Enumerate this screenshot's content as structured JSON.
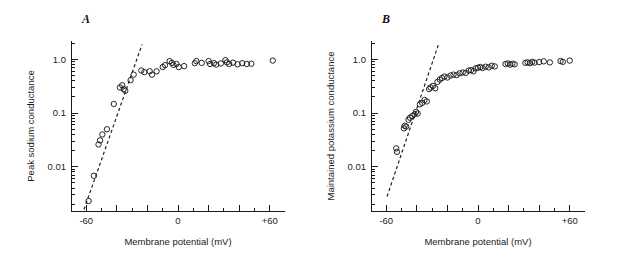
{
  "figure": {
    "background": "#ffffff",
    "ink_color": "#1a1a1a",
    "width": 620,
    "height": 263
  },
  "panels": [
    {
      "id": "A",
      "label": "A",
      "xlabel": "Membrane potential (mV)",
      "ylabel": "Peak sodium conductance"
    },
    {
      "id": "B",
      "label": "B",
      "xlabel": "Membrane potential (mV)",
      "ylabel": "Maintained potassium conductance"
    }
  ],
  "chart_data": [
    {
      "type": "scatter",
      "panel": "A",
      "title": "A",
      "xlabel": "Membrane potential (mV)",
      "ylabel": "Peak sodium conductance",
      "xlim": [
        -70,
        70
      ],
      "ylim": [
        0.0015,
        2.2
      ],
      "yscale": "log",
      "grid": false,
      "legend": null,
      "xticks": [
        -60,
        -40,
        -20,
        0,
        20,
        40,
        60
      ],
      "xticklabels": [
        "-60",
        "",
        "",
        "0",
        "",
        "",
        "+60"
      ],
      "xtick_minor_step": 10,
      "yticks": [
        1.0,
        0.1,
        0.01
      ],
      "yticklabels": [
        "1.0",
        "0.1",
        "0.01"
      ],
      "marker": "open-circle",
      "annotations": [
        {
          "type": "dashed-fit-line",
          "x0": -61.5,
          "y0": 0.0016,
          "x1": -23.5,
          "y1": 1.9
        }
      ],
      "x": [
        -58.5,
        -55.0,
        -52.0,
        -51.0,
        -49.5,
        -46.5,
        -42.0,
        -38.0,
        -36.5,
        -35.5,
        -34.5,
        -31.0,
        -29.0,
        -24.0,
        -22.0,
        -18.5,
        -17.0,
        -14.0,
        -10.0,
        -8.5,
        -5.5,
        -4.0,
        -3.0,
        -1.0,
        0.5,
        4.0,
        11.0,
        12.0,
        15.5,
        20.0,
        21.0,
        23.5,
        25.0,
        28.0,
        31.0,
        32.0,
        33.5,
        36.0,
        39.0,
        42.0,
        45.0,
        48.0,
        62.0
      ],
      "y": [
        0.0023,
        0.0068,
        0.026,
        0.031,
        0.04,
        0.05,
        0.148,
        0.3,
        0.33,
        0.28,
        0.26,
        0.41,
        0.52,
        0.62,
        0.58,
        0.6,
        0.52,
        0.6,
        0.72,
        0.78,
        0.93,
        0.86,
        0.79,
        0.82,
        0.72,
        0.75,
        0.85,
        0.93,
        0.86,
        0.93,
        0.82,
        0.85,
        0.8,
        0.84,
        0.97,
        0.88,
        0.82,
        0.87,
        0.81,
        0.85,
        0.82,
        0.83,
        0.95
      ]
    },
    {
      "type": "scatter",
      "panel": "B",
      "title": "B",
      "xlabel": "Membrane potential (mV)",
      "ylabel": "Maintained potassium conductance",
      "xlim": [
        -70,
        70
      ],
      "ylim": [
        0.0015,
        2.2
      ],
      "yscale": "log",
      "grid": false,
      "legend": null,
      "xticks": [
        -60,
        -40,
        -20,
        0,
        20,
        40,
        60
      ],
      "xticklabels": [
        "-60",
        "",
        "",
        "0",
        "",
        "",
        "+60"
      ],
      "xtick_minor_step": 10,
      "yticks": [
        1.0,
        0.1,
        0.01
      ],
      "yticklabels": [
        "1.0",
        "0.1",
        "0.01"
      ],
      "marker": "open-circle",
      "annotations": [
        {
          "type": "dashed-fit-line",
          "x0": -59.5,
          "y0": 0.0028,
          "x1": -26.0,
          "y1": 1.85
        }
      ],
      "x": [
        -53.5,
        -53.0,
        -48.5,
        -48.0,
        -47.0,
        -45.5,
        -44.5,
        -43.0,
        -41.5,
        -40.5,
        -39.5,
        -38.0,
        -36.5,
        -35.0,
        -33.5,
        -32.0,
        -31.0,
        -29.5,
        -28.0,
        -26.5,
        -25.0,
        -23.5,
        -22.0,
        -20.0,
        -18.0,
        -16.0,
        -14.0,
        -12.0,
        -10.0,
        -8.0,
        -6.0,
        -4.5,
        -3.0,
        -1.5,
        0.0,
        1.5,
        3.0,
        5.0,
        7.0,
        9.0,
        11.0,
        18.0,
        19.5,
        21.0,
        22.5,
        24.0,
        31.0,
        32.5,
        34.0,
        35.5,
        37.0,
        40.0,
        43.0,
        47.0,
        54.0,
        55.5,
        60.0
      ],
      "y": [
        0.022,
        0.019,
        0.052,
        0.058,
        0.056,
        0.075,
        0.082,
        0.088,
        0.095,
        0.105,
        0.098,
        0.145,
        0.155,
        0.175,
        0.165,
        0.28,
        0.3,
        0.32,
        0.29,
        0.38,
        0.42,
        0.45,
        0.48,
        0.46,
        0.5,
        0.52,
        0.51,
        0.55,
        0.57,
        0.56,
        0.62,
        0.63,
        0.6,
        0.68,
        0.7,
        0.72,
        0.69,
        0.73,
        0.71,
        0.76,
        0.74,
        0.82,
        0.84,
        0.8,
        0.83,
        0.81,
        0.86,
        0.88,
        0.85,
        0.9,
        0.87,
        0.89,
        0.92,
        0.88,
        0.93,
        0.9,
        0.95
      ]
    }
  ]
}
